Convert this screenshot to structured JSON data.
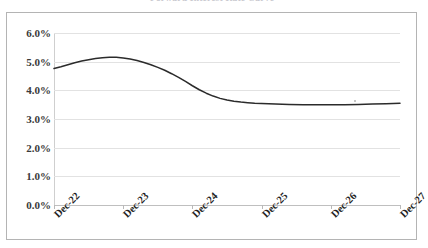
{
  "figure": {
    "title": "Forward Interest Rate Curve",
    "frame_color": "#b4b4b4",
    "background": "#ffffff"
  },
  "axes": {
    "y": {
      "label": "",
      "tick_labels": [
        "6.0%",
        "5.0%",
        "4.0%",
        "3.0%",
        "2.0%",
        "1.0%",
        "0.0%"
      ],
      "min": 0.0,
      "max": 6.0,
      "step": 1.0,
      "gridlines": true,
      "gridline_color": "#e2e2e2"
    },
    "x": {
      "label": "",
      "tick_labels": [
        "Dec-22",
        "Dec-23",
        "Dec-24",
        "Dec-25",
        "Dec-26",
        "Dec-27"
      ],
      "label_rotation": -45
    }
  },
  "series_style": {
    "line_color": "#2b2b2b",
    "line_width": 1.5,
    "markers": false
  },
  "chart_data": {
    "type": "line",
    "title": "Forward Interest Rate Curve",
    "subtitle": "",
    "xlabel": "",
    "ylabel": "",
    "ylim": [
      0.0,
      6.0
    ],
    "ytick_values": [
      0.0,
      1.0,
      2.0,
      3.0,
      4.0,
      5.0,
      6.0
    ],
    "ytick_labels": [
      "0.0%",
      "1.0%",
      "2.0%",
      "3.0%",
      "4.0%",
      "5.0%",
      "6.0%"
    ],
    "xtick_labels": [
      "Dec-22",
      "Dec-23",
      "Dec-24",
      "Dec-25",
      "Dec-26",
      "Dec-27"
    ],
    "xtick_positions": [
      0,
      1,
      2,
      3,
      4,
      5
    ],
    "grid": true,
    "legend": false,
    "legend_position": "none",
    "units": "percent",
    "series": [
      {
        "name": "Forward rate",
        "x": [
          0.0,
          0.1,
          0.2,
          0.3,
          0.4,
          0.5,
          0.6,
          0.7,
          0.8,
          0.9,
          1.0,
          1.1,
          1.2,
          1.3,
          1.4,
          1.5,
          1.6,
          1.7,
          1.8,
          1.9,
          2.0,
          2.1,
          2.2,
          2.3,
          2.4,
          2.5,
          2.6,
          2.7,
          2.8,
          2.9,
          3.0,
          3.2,
          3.4,
          3.6,
          3.8,
          4.0,
          4.2,
          4.4,
          4.6,
          4.8,
          5.0
        ],
        "values": [
          4.76,
          4.82,
          4.89,
          4.96,
          5.02,
          5.07,
          5.11,
          5.14,
          5.15,
          5.15,
          5.13,
          5.09,
          5.04,
          4.97,
          4.89,
          4.8,
          4.7,
          4.58,
          4.45,
          4.31,
          4.16,
          4.02,
          3.9,
          3.8,
          3.72,
          3.66,
          3.62,
          3.59,
          3.57,
          3.55,
          3.54,
          3.52,
          3.51,
          3.5,
          3.5,
          3.5,
          3.5,
          3.51,
          3.52,
          3.53,
          3.55
        ],
        "color": "#2b2b2b",
        "start_value": 4.76,
        "peak_value": 5.15,
        "peak_at": "Dec-23",
        "trough_value": 3.5,
        "end_value": 3.55
      }
    ]
  }
}
